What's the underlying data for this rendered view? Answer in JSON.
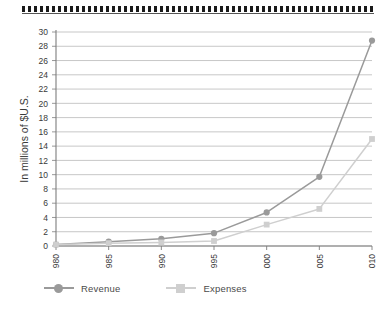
{
  "decoration": {
    "top_border_name": "hatched-rule"
  },
  "chart_data": {
    "type": "line",
    "title": "",
    "subtitle": "",
    "xlabel": "",
    "ylabel": "In millions of $U.S.",
    "categories": [
      "1980",
      "1985",
      "1990",
      "1995",
      "2000",
      "2005",
      "2010"
    ],
    "x_tick_labels": [
      "1980",
      "1985",
      "1990",
      "1995",
      "2000",
      "2005",
      "2010"
    ],
    "x_tick_rotation": 90,
    "y_tick_labels": [
      "0",
      "2",
      "4",
      "6",
      "8",
      "10",
      "12",
      "14",
      "16",
      "18",
      "20",
      "22",
      "24",
      "26",
      "28",
      "30"
    ],
    "y_ticks": [
      0,
      2,
      4,
      6,
      8,
      10,
      12,
      14,
      16,
      18,
      20,
      22,
      24,
      26,
      28,
      30
    ],
    "ylim": [
      0,
      30
    ],
    "grid": true,
    "grid_axis": "y",
    "legend_position": "bottom-left",
    "series": [
      {
        "name": "Revenue",
        "marker": "circle",
        "color": "#9a9a9a",
        "values": [
          0.2,
          0.6,
          1.0,
          1.8,
          4.7,
          9.7,
          28.8
        ]
      },
      {
        "name": "Expenses",
        "marker": "square",
        "color": "#cfcfcf",
        "values": [
          0.2,
          0.4,
          0.5,
          0.7,
          3.0,
          5.2,
          15.0
        ]
      }
    ]
  },
  "legend": {
    "items": [
      {
        "label": "Revenue",
        "marker": "circle",
        "color": "#9a9a9a"
      },
      {
        "label": "Expenses",
        "marker": "square",
        "color": "#cfcfcf"
      }
    ]
  },
  "colors": {
    "revenue": "#9a9a9a",
    "expenses": "#cfcfcf",
    "grid": "#b9b9b9",
    "axis": "#7d7d7d",
    "text": "#3a3a3a"
  }
}
